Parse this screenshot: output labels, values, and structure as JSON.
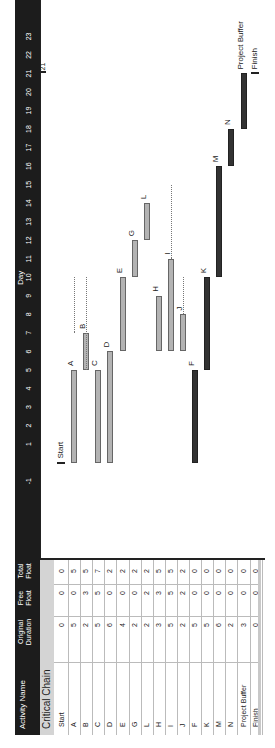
{
  "table": {
    "headers": {
      "activity_name": "Activity Name",
      "original_duration": "Original Duration",
      "free_float": "Free Float",
      "total_float": "Total Float"
    },
    "group_label": "Critical Chain",
    "rows": [
      {
        "name": "Start",
        "duration": "0",
        "free_float": "0",
        "total_float": "0"
      },
      {
        "name": "A",
        "duration": "5",
        "free_float": "0",
        "total_float": "5"
      },
      {
        "name": "B",
        "duration": "2",
        "free_float": "3",
        "total_float": "5"
      },
      {
        "name": "C",
        "duration": "5",
        "free_float": "5",
        "total_float": "7"
      },
      {
        "name": "D",
        "duration": "6",
        "free_float": "0",
        "total_float": "2"
      },
      {
        "name": "E",
        "duration": "4",
        "free_float": "0",
        "total_float": "2"
      },
      {
        "name": "G",
        "duration": "2",
        "free_float": "0",
        "total_float": "2"
      },
      {
        "name": "L",
        "duration": "2",
        "free_float": "2",
        "total_float": "2"
      },
      {
        "name": "H",
        "duration": "3",
        "free_float": "3",
        "total_float": "5"
      },
      {
        "name": "I",
        "duration": "5",
        "free_float": "5",
        "total_float": "5"
      },
      {
        "name": "J",
        "duration": "2",
        "free_float": "2",
        "total_float": "2"
      },
      {
        "name": "F",
        "duration": "5",
        "free_float": "0",
        "total_float": "0"
      },
      {
        "name": "K",
        "duration": "5",
        "free_float": "0",
        "total_float": "0"
      },
      {
        "name": "M",
        "duration": "6",
        "free_float": "0",
        "total_float": "0"
      },
      {
        "name": "N",
        "duration": "2",
        "free_float": "0",
        "total_float": "0"
      },
      {
        "name": "Project Buffer",
        "duration": "3",
        "free_float": "0",
        "total_float": "0"
      },
      {
        "name": "Finish",
        "duration": "0",
        "free_float": "0",
        "total_float": "0"
      }
    ]
  },
  "timeline": {
    "title": "Day",
    "ticks": [
      "-1",
      "1",
      "2",
      "3",
      "4",
      "5",
      "6",
      "7",
      "8",
      "9",
      "10",
      "11",
      "12",
      "13",
      "14",
      "15",
      "16",
      "17",
      "18",
      "19",
      "20",
      "21",
      "22",
      "23"
    ],
    "end_marker": "21"
  },
  "chart_data": {
    "type": "gantt",
    "title": "Critical Chain",
    "xlabel": "Day",
    "xlim": [
      -1,
      23
    ],
    "tasks": [
      {
        "name": "Start",
        "start": 0,
        "duration": 0,
        "critical": true,
        "milestone": true
      },
      {
        "name": "A",
        "start": 0,
        "duration": 5,
        "critical": false
      },
      {
        "name": "B",
        "start": 5,
        "duration": 2,
        "critical": false
      },
      {
        "name": "C",
        "start": 0,
        "duration": 5,
        "critical": false
      },
      {
        "name": "D",
        "start": 0,
        "duration": 6,
        "critical": false
      },
      {
        "name": "E",
        "start": 6,
        "duration": 4,
        "critical": false
      },
      {
        "name": "G",
        "start": 10,
        "duration": 2,
        "critical": false
      },
      {
        "name": "L",
        "start": 12,
        "duration": 2,
        "critical": false
      },
      {
        "name": "H",
        "start": 6,
        "duration": 3,
        "critical": false
      },
      {
        "name": "I",
        "start": 6,
        "duration": 5,
        "critical": false
      },
      {
        "name": "J",
        "start": 6,
        "duration": 2,
        "critical": false
      },
      {
        "name": "F",
        "start": 0,
        "duration": 5,
        "critical": true
      },
      {
        "name": "K",
        "start": 5,
        "duration": 5,
        "critical": true
      },
      {
        "name": "M",
        "start": 10,
        "duration": 6,
        "critical": true
      },
      {
        "name": "N",
        "start": 16,
        "duration": 2,
        "critical": true
      },
      {
        "name": "Project Buffer",
        "start": 18,
        "duration": 3,
        "critical": true
      },
      {
        "name": "Finish",
        "start": 21,
        "duration": 0,
        "critical": true,
        "milestone": true
      }
    ],
    "end_marker": 21,
    "colors": {
      "critical": "#333333",
      "non_critical": "#b3b3b3",
      "header": "#1c1c1c"
    }
  }
}
